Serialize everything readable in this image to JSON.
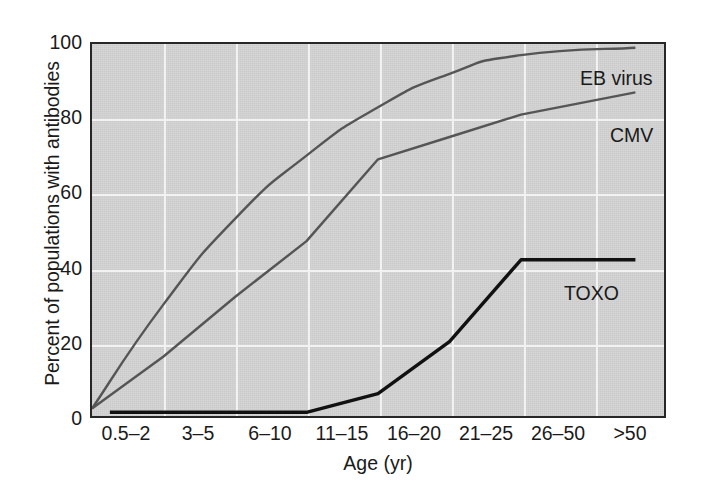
{
  "chart_data": {
    "type": "line",
    "title": "",
    "subtitle": "",
    "xlabel": "Age (yr)",
    "ylabel": "Percent of populations with antibodies",
    "categories": [
      "0.5–2",
      "3–5",
      "6–10",
      "11–15",
      "16–20",
      "21–25",
      "26–50",
      ">50"
    ],
    "x_tick_labels": [
      "0.5–2",
      "3–5",
      "6–10",
      "11–15",
      "16–20",
      "21–25",
      "26–50",
      ">50"
    ],
    "y_tick_labels": [
      "0",
      "20",
      "40",
      "60",
      "80",
      "100"
    ],
    "y_ticks": [
      0,
      20,
      40,
      60,
      80,
      100
    ],
    "ylim": [
      0,
      100
    ],
    "xlim": [
      0,
      8
    ],
    "grid": true,
    "grid_color": "#f2f2f2",
    "plot_background": "#d4d4d4",
    "legend_position": "inline-annotation",
    "series": [
      {
        "name": "EB virus",
        "color": "#555555",
        "line_width": 2.4,
        "label_annotation": "EB virus",
        "values": [
          2,
          30,
          53,
          70,
          83,
          92,
          97,
          99
        ],
        "x_positions": [
          0,
          1,
          2,
          3,
          4,
          5,
          6,
          7.6
        ],
        "smooth": true
      },
      {
        "name": "CMV",
        "color": "#555555",
        "line_width": 2.4,
        "label_annotation": "CMV",
        "values": [
          2,
          16,
          32,
          47,
          69,
          75,
          81,
          87
        ],
        "x_positions": [
          0,
          1,
          2,
          3,
          4,
          5,
          6,
          7.6
        ],
        "smooth": false
      },
      {
        "name": "TOXO",
        "color": "#111111",
        "line_width": 3.4,
        "label_annotation": "TOXO",
        "values": [
          1,
          1,
          1,
          1,
          6,
          20,
          42,
          42
        ],
        "x_positions": [
          0.25,
          1,
          2,
          3,
          4,
          5,
          6,
          7.6
        ],
        "smooth": false
      }
    ],
    "annotations": [
      {
        "text": "EB virus",
        "series": "EB virus",
        "x_px": 578,
        "y_px": 65
      },
      {
        "text": "CMV",
        "series": "CMV",
        "x_px": 608,
        "y_px": 122
      },
      {
        "text": "TOXO",
        "series": "TOXO",
        "x_px": 562,
        "y_px": 280
      }
    ]
  }
}
